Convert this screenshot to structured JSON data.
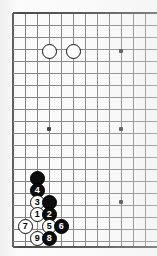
{
  "diagram": {
    "board_size": 19,
    "visible_columns": 12,
    "visible_rows": 20,
    "grid_spacing_px": 12,
    "grid_origin": {
      "x": 13,
      "y": 13
    },
    "colors": {
      "board_background": "#fbfbfb",
      "grid_line": "#6b6b6b",
      "edge_line": "#2b2b2b",
      "black_stone": "#0d0d0d",
      "white_stone": "#ffffff",
      "black_label": "#ffffff",
      "white_label": "#000000"
    },
    "edges": {
      "left_edge": true,
      "top_edge": true,
      "bottom_edge": true,
      "right_edge": false
    }
  },
  "star_points": [
    {
      "name": "star-point-1",
      "x": 49,
      "y": 51
    },
    {
      "name": "star-point-2",
      "x": 121,
      "y": 51
    },
    {
      "name": "star-point-3",
      "x": 49,
      "y": 129
    },
    {
      "name": "star-point-4",
      "x": 121,
      "y": 129
    },
    {
      "name": "star-point-5",
      "x": 121,
      "y": 202
    }
  ],
  "grid": {
    "vertical_x": [
      13,
      25,
      37,
      49,
      61,
      73,
      85,
      97,
      109,
      121,
      133,
      145,
      157
    ],
    "horizontal_y": [
      13,
      25,
      37,
      49,
      61,
      73,
      85,
      97,
      109,
      121,
      133,
      145,
      157,
      169,
      181,
      193,
      205,
      217,
      229,
      241,
      247
    ]
  },
  "stones": [
    {
      "name": "white-stone-a",
      "color": "white",
      "label": "",
      "x": 49,
      "y": 51
    },
    {
      "name": "white-stone-b",
      "color": "white",
      "label": "",
      "x": 73,
      "y": 51
    },
    {
      "name": "black-stone-unnumbered-a",
      "color": "black",
      "label": "",
      "x": 37,
      "y": 178
    },
    {
      "name": "black-stone-move-4",
      "color": "black",
      "label": "4",
      "x": 37,
      "y": 190
    },
    {
      "name": "white-stone-move-3",
      "color": "white",
      "label": "3",
      "x": 37,
      "y": 202
    },
    {
      "name": "black-stone-unnumbered-b",
      "color": "black",
      "label": "",
      "x": 49,
      "y": 202
    },
    {
      "name": "white-stone-move-1",
      "color": "white",
      "label": "1",
      "x": 37,
      "y": 214
    },
    {
      "name": "black-stone-move-2",
      "color": "black",
      "label": "2",
      "x": 49,
      "y": 214
    },
    {
      "name": "white-stone-move-7",
      "color": "white",
      "label": "7",
      "x": 25,
      "y": 226
    },
    {
      "name": "white-stone-move-5",
      "color": "white",
      "label": "5",
      "x": 49,
      "y": 226
    },
    {
      "name": "black-stone-move-6",
      "color": "black",
      "label": "6",
      "x": 61,
      "y": 226
    },
    {
      "name": "white-stone-move-9",
      "color": "white",
      "label": "9",
      "x": 37,
      "y": 238
    },
    {
      "name": "black-stone-move-8",
      "color": "black",
      "label": "8",
      "x": 49,
      "y": 238
    }
  ],
  "move_sequence": [
    "1",
    "2",
    "3",
    "4",
    "5",
    "6",
    "7",
    "8",
    "9"
  ]
}
